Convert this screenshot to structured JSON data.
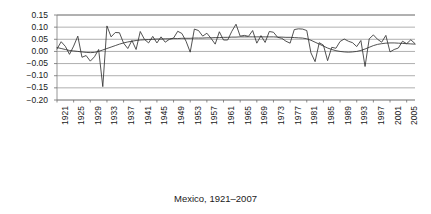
{
  "chart_data": {
    "type": "line",
    "title": "",
    "caption": "Mexico, 1921–2007",
    "xlabel": "",
    "ylabel": "",
    "ylim": [
      -0.2,
      0.15
    ],
    "xlim": [
      1921,
      2007
    ],
    "grid": true,
    "grid_axis": "y",
    "legend": false,
    "legend_position": "none",
    "ytick_labels": [
      "0.15",
      "0.10",
      "0.05",
      "0.00",
      "−0.05",
      "−0.10",
      "−0.15",
      "−0.20"
    ],
    "ytick_values": [
      0.15,
      0.1,
      0.05,
      0.0,
      -0.05,
      -0.1,
      -0.15,
      -0.2
    ],
    "xtick_labels": [
      "1921",
      "1925",
      "1929",
      "1933",
      "1937",
      "1941",
      "1945",
      "1949",
      "1953",
      "1957",
      "1961",
      "1965",
      "1969",
      "1973",
      "1977",
      "1981",
      "1985",
      "1989",
      "1993",
      "1997",
      "2001",
      "2005"
    ],
    "xtick_values": [
      1921,
      1925,
      1929,
      1933,
      1937,
      1941,
      1945,
      1949,
      1953,
      1957,
      1961,
      1965,
      1969,
      1973,
      1977,
      1981,
      1985,
      1989,
      1993,
      1997,
      2001,
      2005
    ],
    "xtick_rotation": 90,
    "x": [
      1921,
      1922,
      1923,
      1924,
      1925,
      1926,
      1927,
      1928,
      1929,
      1930,
      1931,
      1932,
      1933,
      1934,
      1935,
      1936,
      1937,
      1938,
      1939,
      1940,
      1941,
      1942,
      1943,
      1944,
      1945,
      1946,
      1947,
      1948,
      1949,
      1950,
      1951,
      1952,
      1953,
      1954,
      1955,
      1956,
      1957,
      1958,
      1959,
      1960,
      1961,
      1962,
      1963,
      1964,
      1965,
      1966,
      1967,
      1968,
      1969,
      1970,
      1971,
      1972,
      1973,
      1974,
      1975,
      1976,
      1977,
      1978,
      1979,
      1980,
      1981,
      1982,
      1983,
      1984,
      1985,
      1986,
      1987,
      1988,
      1989,
      1990,
      1991,
      1992,
      1993,
      1994,
      1995,
      1996,
      1997,
      1998,
      1999,
      2000,
      2001,
      2002,
      2003,
      2004,
      2005,
      2006,
      2007
    ],
    "series": [
      {
        "name": "annual-growth-rate",
        "type": "line",
        "color": "#333333",
        "values": [
          0.01,
          0.04,
          0.021,
          -0.012,
          0.022,
          0.063,
          -0.024,
          -0.017,
          -0.04,
          -0.022,
          0.008,
          -0.145,
          0.105,
          0.06,
          0.078,
          0.077,
          0.034,
          0.012,
          0.045,
          0.008,
          0.082,
          0.05,
          0.035,
          0.062,
          0.035,
          0.06,
          0.038,
          0.05,
          0.055,
          0.083,
          0.074,
          0.042,
          -0.003,
          0.092,
          0.086,
          0.063,
          0.075,
          0.054,
          0.03,
          0.081,
          0.047,
          0.047,
          0.083,
          0.112,
          0.063,
          0.066,
          0.062,
          0.086,
          0.034,
          0.065,
          0.037,
          0.082,
          0.079,
          0.058,
          0.054,
          0.042,
          0.034,
          0.09,
          0.093,
          0.092,
          0.086,
          -0.006,
          -0.042,
          0.036,
          0.026,
          -0.038,
          0.017,
          0.013,
          0.041,
          0.051,
          0.042,
          0.036,
          0.02,
          0.045,
          -0.062,
          0.052,
          0.068,
          0.05,
          0.038,
          0.066,
          -0.002,
          0.008,
          0.014,
          0.042,
          0.032,
          0.048,
          0.032
        ]
      },
      {
        "name": "smoothed-trend",
        "type": "line",
        "color": "#333333",
        "values": [
          0.016,
          0.012,
          0.008,
          0.004,
          0.002,
          0.0,
          -0.002,
          -0.004,
          -0.005,
          -0.004,
          0.0,
          0.006,
          0.012,
          0.018,
          0.024,
          0.03,
          0.035,
          0.039,
          0.042,
          0.045,
          0.047,
          0.048,
          0.049,
          0.05,
          0.051,
          0.051,
          0.052,
          0.052,
          0.053,
          0.053,
          0.054,
          0.054,
          0.054,
          0.055,
          0.055,
          0.055,
          0.056,
          0.056,
          0.057,
          0.057,
          0.058,
          0.058,
          0.059,
          0.059,
          0.06,
          0.06,
          0.06,
          0.06,
          0.06,
          0.06,
          0.06,
          0.06,
          0.06,
          0.059,
          0.059,
          0.058,
          0.058,
          0.057,
          0.056,
          0.055,
          0.052,
          0.046,
          0.038,
          0.03,
          0.022,
          0.014,
          0.008,
          0.003,
          0.0,
          -0.002,
          -0.003,
          -0.002,
          0.0,
          0.004,
          0.01,
          0.017,
          0.024,
          0.029,
          0.032,
          0.034,
          0.035,
          0.035,
          0.034,
          0.033,
          0.032,
          0.031,
          0.03
        ]
      }
    ]
  }
}
